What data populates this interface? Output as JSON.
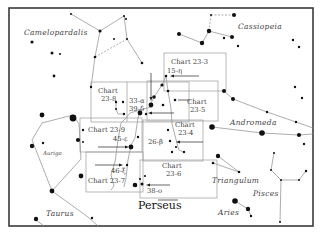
{
  "figure": {
    "title": "Perseus",
    "constellations": [
      {
        "name": "Camelopardalis",
        "x": 24,
        "y": 35
      },
      {
        "name": "Cassiopeia",
        "x": 238,
        "y": 29
      },
      {
        "name": "Andromeda",
        "x": 230,
        "y": 125
      },
      {
        "name": "Auriga",
        "x": 43,
        "y": 155,
        "small": true
      },
      {
        "name": "Triangulum",
        "x": 212,
        "y": 183
      },
      {
        "name": "Pisces",
        "x": 253,
        "y": 196
      },
      {
        "name": "Aries",
        "x": 218,
        "y": 215
      },
      {
        "name": "Taurus",
        "x": 46,
        "y": 216
      }
    ],
    "charts": [
      {
        "id": "23-3",
        "label1": "Chart 23-3",
        "label2": "",
        "x": 163,
        "y": 53,
        "w": 63,
        "h": 38
      },
      {
        "id": "23-8",
        "label1": "Chart",
        "label2": "23-8",
        "x": 91,
        "y": 82,
        "w": 42,
        "h": 40
      },
      {
        "id": "23-5",
        "label1": "Chart",
        "label2": "23-5",
        "x": 180,
        "y": 81,
        "w": 38,
        "h": 40
      },
      {
        "id": "23-9",
        "label1": "Chart 23-9",
        "label2": "",
        "x": 80,
        "y": 118,
        "w": 60,
        "h": 32
      },
      {
        "id": "23-4",
        "label1": "Chart",
        "label2": "23-4",
        "x": 143,
        "y": 120,
        "w": 60,
        "h": 40
      },
      {
        "id": "23-7",
        "label1": "Chart 23-7",
        "label2": "",
        "x": 86,
        "y": 151,
        "w": 57,
        "h": 40
      },
      {
        "id": "23-6",
        "label1": "Chart",
        "label2": "23-6",
        "x": 140,
        "y": 160,
        "w": 77,
        "h": 38
      }
    ],
    "stars": [
      {
        "label": "15-η"
      },
      {
        "label": "33-α"
      },
      {
        "label": "39-δ"
      },
      {
        "label": "45-ε"
      },
      {
        "label": "26-β"
      },
      {
        "label": "46-ξ"
      },
      {
        "label": "38-ο"
      }
    ],
    "chart_labels": {
      "c233": "Chart 23-3",
      "c238a": "Chart",
      "c238b": "23-8",
      "c235a": "Chart",
      "c235b": "23-5",
      "c239": "Chart 23-9",
      "c234a": "Chart",
      "c234b": "23-4",
      "c237": "Chart 23-7",
      "c236a": "Chart",
      "c236b": "23-6"
    }
  }
}
